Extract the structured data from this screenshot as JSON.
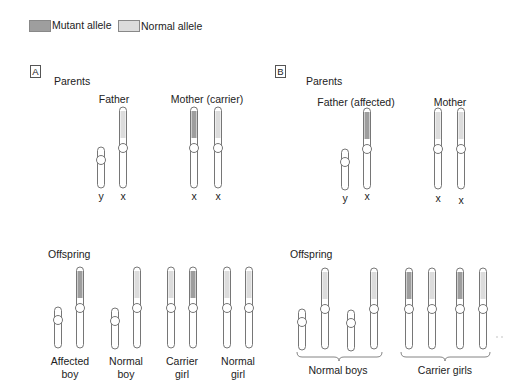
{
  "legend": {
    "mutant_label": "Mutant allele",
    "normal_label": "Normal allele",
    "mutant_color": "#9e9e9e",
    "normal_color": "#dcdcdc"
  },
  "panel_a": {
    "box_label": "A",
    "parents_label": "Parents",
    "father_label": "Father",
    "mother_label": "Mother (carrier)",
    "father_chromosomes": [
      "y",
      "x"
    ],
    "mother_chromosomes": [
      "x",
      "x"
    ],
    "offspring_label": "Offspring",
    "offspring": [
      {
        "line1": "Affected",
        "line2": "boy"
      },
      {
        "line1": "Normal",
        "line2": "boy"
      },
      {
        "line1": "Carrier",
        "line2": "girl"
      },
      {
        "line1": "Normal",
        "line2": "girl"
      }
    ]
  },
  "panel_b": {
    "box_label": "B",
    "parents_label": "Parents",
    "father_label": "Father (affected)",
    "mother_label": "Mother",
    "father_chromosomes": [
      "y",
      "x"
    ],
    "mother_chromosomes": [
      "x",
      "x"
    ],
    "offspring_label": "Offspring",
    "group_labels": [
      "Normal boys",
      "Carrier girls"
    ]
  }
}
